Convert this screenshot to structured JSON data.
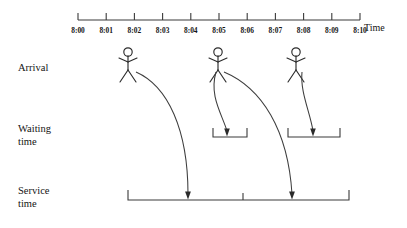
{
  "diagram": {
    "background_color": "#ffffff",
    "line_color": "#3a3a3a",
    "figure_color": "#2b2b2b",
    "axis": {
      "name": "Time",
      "name_x": 364,
      "name_y": 30,
      "line_y": 20,
      "line_x_start": 78,
      "line_x_end": 360,
      "tick_spacing": 28.2,
      "tick_height": 7,
      "label_y": 33,
      "ticks": [
        {
          "label": "8:00",
          "x": 78
        },
        {
          "label": "8:01",
          "x": 106.2
        },
        {
          "label": "8:02",
          "x": 134.4
        },
        {
          "label": "8:03",
          "x": 162.6
        },
        {
          "label": "8:04",
          "x": 190.8
        },
        {
          "label": "8:05",
          "x": 219.0
        },
        {
          "label": "8:06",
          "x": 247.2
        },
        {
          "label": "8:07",
          "x": 275.4
        },
        {
          "label": "8:08",
          "x": 303.6
        },
        {
          "label": "8:09",
          "x": 331.8
        },
        {
          "label": "8:10",
          "x": 360.0
        }
      ]
    },
    "rows": [
      {
        "id": "arrival",
        "label": "Arrival",
        "label_x": 18,
        "label_y": 70,
        "lines": [
          "Arrival"
        ]
      },
      {
        "id": "waiting",
        "label": "Waiting time",
        "label_x": 18,
        "label_y": 131,
        "lines": [
          "Waiting",
          "time"
        ]
      },
      {
        "id": "service",
        "label": "Service time",
        "label_x": 18,
        "label_y": 193,
        "lines": [
          "Service",
          "time"
        ]
      }
    ],
    "customers": [
      {
        "id": "customer-1",
        "arrival_time": "8:02",
        "figure_x": 128,
        "head_cy": 52,
        "outcome": "service"
      },
      {
        "id": "customer-2",
        "arrival_time": "8:05",
        "figure_x": 218,
        "head_cy": 52,
        "outcome": "waiting-then-service"
      },
      {
        "id": "customer-3",
        "arrival_time": "8:08",
        "figure_x": 296,
        "head_cy": 52,
        "outcome": "waiting"
      }
    ],
    "waiting_brackets": [
      {
        "id": "waiting-bracket-1",
        "x_start": 213,
        "x_end": 247,
        "y_base": 137,
        "arm_height": 9,
        "arrow_x": 227
      },
      {
        "id": "waiting-bracket-2",
        "x_start": 288,
        "x_end": 340,
        "y_base": 137,
        "arm_height": 9,
        "arrow_x": 313
      }
    ],
    "service_bracket": {
      "id": "service-bracket",
      "x_start": 128,
      "x_end": 349,
      "y_base": 200,
      "arm_height": 10,
      "dividers": [
        243
      ],
      "arrows": [
        188,
        292
      ]
    },
    "curves": [
      {
        "id": "curve-customer-1-to-service",
        "from": "customer-1",
        "to": "service",
        "start_x": 136,
        "start_y": 72,
        "end_x": 188,
        "end_y": 198
      },
      {
        "id": "curve-customer-2-to-waiting",
        "from": "customer-2",
        "to": "waiting-bracket-1",
        "start_x": 216,
        "start_y": 72,
        "end_x": 227,
        "end_y": 135
      },
      {
        "id": "curve-customer-2-to-service",
        "from": "customer-2",
        "to": "service",
        "start_x": 224,
        "start_y": 72,
        "end_x": 292,
        "end_y": 198
      },
      {
        "id": "curve-customer-3-to-waiting",
        "from": "customer-3",
        "to": "waiting-bracket-2",
        "start_x": 302,
        "start_y": 72,
        "end_x": 313,
        "end_y": 135
      }
    ]
  }
}
